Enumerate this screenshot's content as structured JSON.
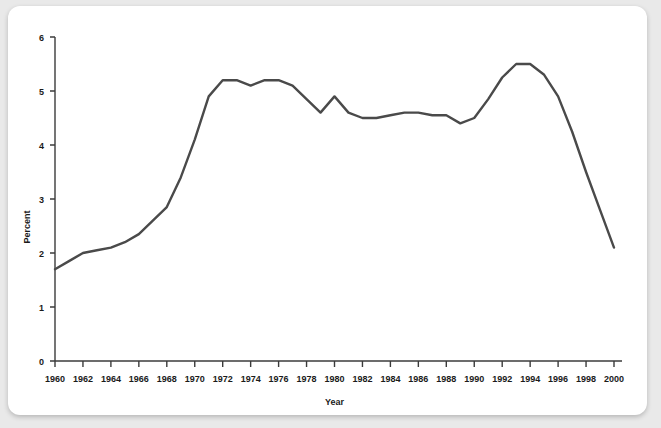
{
  "chart_data": {
    "type": "line",
    "title": "",
    "xlabel": "Year",
    "ylabel": "Percent",
    "xlim": [
      1960,
      2000
    ],
    "ylim": [
      0,
      6
    ],
    "grid": false,
    "legend": null,
    "line_color": "#4a4a4a",
    "x_tick_labels": [
      "1960",
      "1962",
      "1964",
      "1966",
      "1968",
      "1970",
      "1972",
      "1974",
      "1976",
      "1978",
      "1980",
      "1982",
      "1984",
      "1986",
      "1988",
      "1990",
      "1992",
      "1994",
      "1996",
      "1998",
      "2000"
    ],
    "y_tick_labels": [
      "0",
      "1",
      "2",
      "3",
      "4",
      "5",
      "6"
    ],
    "x": [
      1960,
      1961,
      1962,
      1963,
      1964,
      1965,
      1966,
      1967,
      1968,
      1969,
      1970,
      1971,
      1972,
      1973,
      1974,
      1975,
      1976,
      1977,
      1978,
      1979,
      1980,
      1981,
      1982,
      1983,
      1984,
      1985,
      1986,
      1987,
      1988,
      1989,
      1990,
      1991,
      1992,
      1993,
      1994,
      1995,
      1996,
      1997,
      1998,
      1999,
      2000
    ],
    "values": [
      1.7,
      1.85,
      2.0,
      2.05,
      2.1,
      2.2,
      2.35,
      2.6,
      2.85,
      3.4,
      4.1,
      4.9,
      5.2,
      5.2,
      5.1,
      5.2,
      5.2,
      5.1,
      4.85,
      4.6,
      4.9,
      4.6,
      4.5,
      4.5,
      4.55,
      4.6,
      4.6,
      4.55,
      4.55,
      4.4,
      4.5,
      4.85,
      5.25,
      5.5,
      5.5,
      5.3,
      4.9,
      4.25,
      3.5,
      2.8,
      2.1
    ],
    "series_name": "Percent"
  }
}
